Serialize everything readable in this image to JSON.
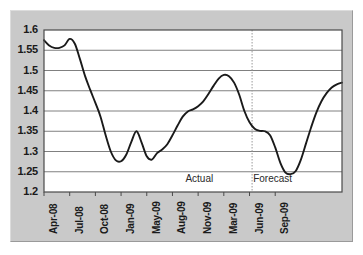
{
  "chart_data": {
    "type": "line",
    "title": "",
    "subtitle": "",
    "xlabel": "",
    "ylabel": "",
    "ylim": [
      1.2,
      1.6
    ],
    "xlim": [
      0,
      30
    ],
    "grid": true,
    "gridlines_y": [
      1.2,
      1.25,
      1.3,
      1.35,
      1.4,
      1.45,
      1.5,
      1.55,
      1.6
    ],
    "legend_position": "none",
    "y_ticks": [
      "1.2",
      "1.25",
      "1.3",
      "1.35",
      "1.4",
      "1.45",
      "1.5",
      "1.55",
      "1.6"
    ],
    "x_ticks": [
      "Apr-08",
      "Jul-08",
      "Oct-08",
      "Jan-09",
      "May-09",
      "Aug-09",
      "Nov-09",
      "Mar-09",
      "Jun-09",
      "Sep-09"
    ],
    "x_tick_positions": [
      0,
      3,
      6,
      9,
      12,
      15,
      18,
      21,
      24,
      27
    ],
    "series": [
      {
        "name": "Exchange rate",
        "x": [
          0,
          0.6,
          1.2,
          1.8,
          2.4,
          3.0,
          3.6,
          4.2,
          4.8,
          5.4,
          6.0,
          6.6,
          7.2,
          7.8,
          8.4,
          9.0,
          9.6,
          10.2,
          10.8,
          11.4,
          12.0,
          12.6,
          13.2,
          13.8,
          14.4,
          15.0,
          15.6,
          16.2,
          16.8,
          17.4,
          18.0,
          18.6,
          19.2,
          19.8,
          20.4,
          21.0,
          21.6,
          22.2,
          22.8,
          23.4,
          24.0,
          24.6,
          25.2,
          25.8,
          26.4,
          27.0,
          27.6,
          28.2,
          28.8,
          29.4
        ],
        "values": [
          1.575,
          1.562,
          1.556,
          1.556,
          1.562,
          1.578,
          1.566,
          1.528,
          1.486,
          1.452,
          1.42,
          1.386,
          1.34,
          1.3,
          1.278,
          1.276,
          1.292,
          1.324,
          1.35,
          1.322,
          1.288,
          1.28,
          1.296,
          1.305,
          1.318,
          1.34,
          1.364,
          1.386,
          1.399,
          1.404,
          1.412,
          1.424,
          1.442,
          1.462,
          1.48,
          1.489,
          1.486,
          1.47,
          1.44,
          1.4,
          1.372,
          1.356,
          1.351,
          1.35,
          1.34,
          1.31,
          1.272,
          1.248,
          1.244,
          1.252
        ]
      },
      {
        "name": "Exchange rate forecast tail",
        "x": [
          29.4,
          30.0,
          30.6,
          31.2,
          31.8,
          32.4,
          33.0,
          33.6,
          34.2,
          34.8
        ],
        "values": [
          1.252,
          1.28,
          1.32,
          1.36,
          1.396,
          1.424,
          1.444,
          1.458,
          1.466,
          1.47
        ]
      }
    ],
    "annotations": [
      {
        "name": "actual",
        "text": "Actual",
        "x": 18.5,
        "y": 1.229
      },
      {
        "name": "forecast",
        "text": "Forecast",
        "x": 27.0,
        "y": 1.229
      }
    ],
    "divider": {
      "name": "actual-forecast-divider",
      "x": 24.3,
      "style": "dotted"
    },
    "colors": {
      "line": "#1a1a1a",
      "grid": "#808080",
      "plot_background": "#ffffff",
      "panel_background": "#c9c9c9",
      "axis": "#4a4a4a",
      "text": "#1a1a1a",
      "divider": "#9a9a9a"
    }
  }
}
